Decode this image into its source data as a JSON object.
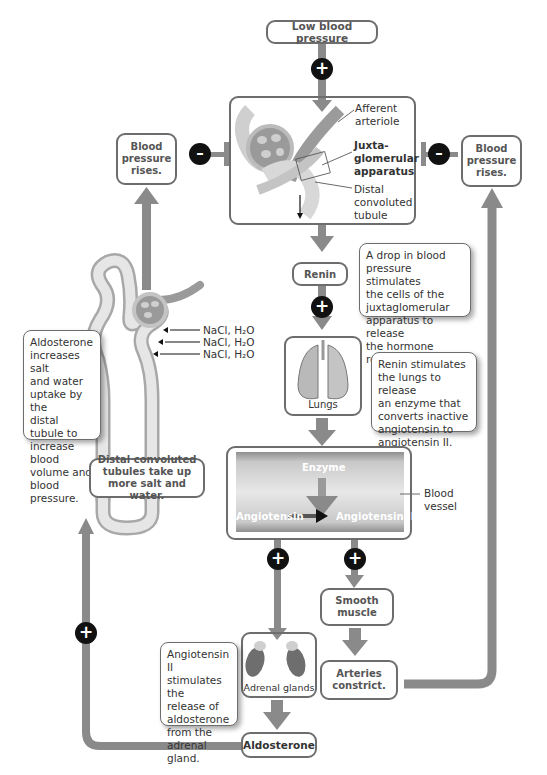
{
  "diagram": {
    "colors": {
      "arrow": "#8a8a8a",
      "box_border": "#6d6d6d",
      "signal": "#111111",
      "text": "#333333"
    },
    "nodes": {
      "low_bp": "Low blood pressure",
      "bp_rises_left": "Blood pressure rises.",
      "bp_rises_right": "Blood pressure rises.",
      "renin": "Renin",
      "lungs": "Lungs",
      "smooth_muscle": "Smooth muscle",
      "adrenal_glands": "Adrenal glands",
      "arteries_constrict": "Arteries constrict.",
      "aldosterone": "Aldosterone",
      "distal_tubules": "Distal convoluted tubules take up more salt and water."
    },
    "kidney_labels": {
      "afferent": "Afferent\narteriole",
      "jga": "Juxta-\nglomerular\napparatus",
      "distal": "Distal\nconvoluted\ntubule"
    },
    "vessel": {
      "enzyme": "Enzyme",
      "angiotensin": "Angiotensin",
      "angiotensin2": "Angiotensin II",
      "blood_vessel": "Blood\nvessel"
    },
    "nacl": [
      "NaCl, H₂O",
      "NaCl, H₂O",
      "NaCl, H₂O"
    ],
    "notes": {
      "renin": "A drop in blood\npressure stimulates\nthe cells of the\njuxtaglomerular\napparatus to release\nthe hormone renin.",
      "lungs": "Renin stimulates\nthe lungs to release\nan enzyme that\nconverts inactive\nangiotensin to\nangiotensin II.",
      "aldosterone": "Aldosterone\nincreases salt\nand water\nuptake by the\ndistal tubule to\nincrease blood\nvolume and\nblood pressure.",
      "angiotensin2": "Angiotensin II\nstimulates the\nrelease of\naldosterone\nfrom the\nadrenal gland."
    },
    "signs": {
      "plus": "+",
      "minus": "–"
    }
  }
}
